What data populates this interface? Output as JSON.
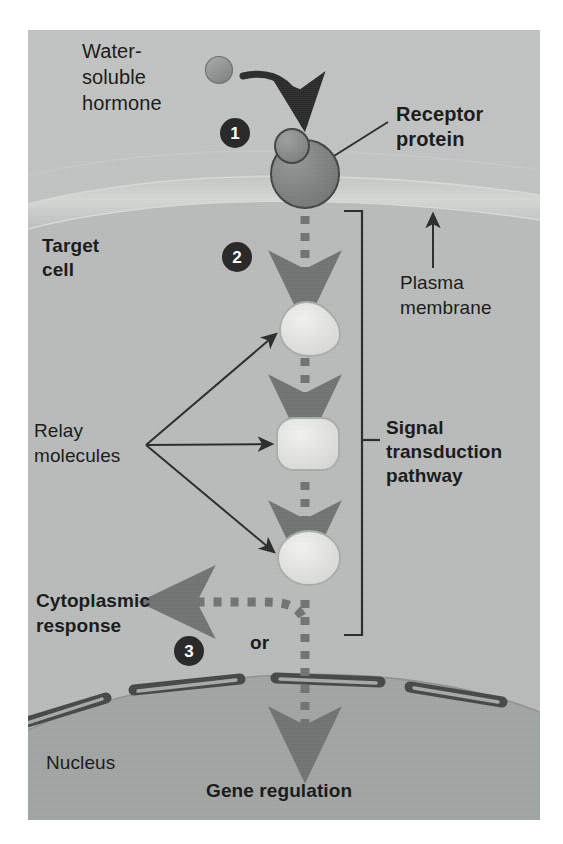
{
  "figure": {
    "background_color": "#b9bcbb",
    "labels": {
      "hormone": "Water-\nsoluble\nhormone",
      "hormone_line1": "Water-",
      "hormone_line2": "soluble",
      "hormone_line3": "hormone",
      "receptor_line1": "Receptor",
      "receptor_line2": "protein",
      "target_cell_line1": "Target",
      "target_cell_line2": "cell",
      "plasma_membrane_line1": "Plasma",
      "plasma_membrane_line2": "membrane",
      "relay_line1": "Relay",
      "relay_line2": "molecules",
      "pathway_line1": "Signal",
      "pathway_line2": "transduction",
      "pathway_line3": "pathway",
      "cytoplasmic_line1": "Cytoplasmic",
      "cytoplasmic_line2": "response",
      "or": "or",
      "nucleus": "Nucleus",
      "gene_regulation": "Gene regulation"
    },
    "steps": [
      {
        "number": "1",
        "meaning": "hormone binds receptor protein"
      },
      {
        "number": "2",
        "meaning": "signal transduction pathway activated"
      },
      {
        "number": "3",
        "meaning": "cytoplasmic response or gene regulation"
      }
    ],
    "colors": {
      "cytoplasm": "#b9bcbb",
      "extracellular": "#c3c5c3",
      "membrane_band": "#cfd1cf",
      "nucleus": "#9fa3a1",
      "hormone_fill": "#8c908e",
      "receptor_fill": "#7e8381",
      "relay_fill": "#e6e7e4",
      "arrow_dark": "#2a2a2a",
      "dashed_arrow": "#6f7472",
      "nuclear_pore": "#4a4f4d",
      "text": "#1c1c1c",
      "badge": "#2a2a2a",
      "badge_text": "#ffffff"
    }
  }
}
